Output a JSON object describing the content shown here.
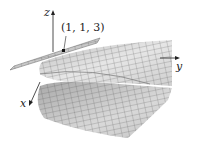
{
  "figure": {
    "axes": {
      "x_label": "x",
      "y_label": "y",
      "z_label": "z"
    },
    "point_label": "(1, 1, 3)",
    "colors": {
      "surface_fill": "#d8d8d8",
      "surface_dark": "#9a9a9a",
      "mesh_line": "#555555",
      "axis": "#222222",
      "background": "#ffffff"
    }
  }
}
